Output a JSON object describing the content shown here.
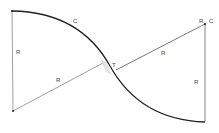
{
  "diagram": {
    "type": "reverse-curve",
    "labels": {
      "c_arc_left": "C",
      "r_left_vertical": "R",
      "r_left_diagonal": "R",
      "t_point": "T",
      "r_right_diagonal": "R",
      "r_right_center": "R",
      "c_right_center": "C",
      "r_right_vertical": "R"
    },
    "colors": {
      "line": "#333333",
      "arc": "#222222",
      "shadow": "#bbbbbb",
      "background": "#ffffff"
    }
  }
}
